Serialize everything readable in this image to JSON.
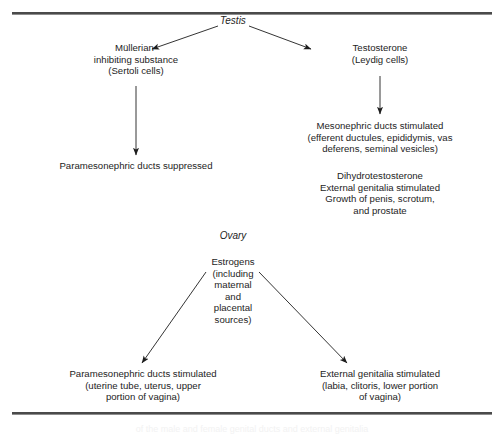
{
  "figure": {
    "type": "flow-diagram",
    "title_clipped": "of the male and female genital ducts and external genitalia",
    "rules": {
      "top_label": "top-horizontal-rule",
      "bottom_label": "bottom-horizontal-rule",
      "color": "#4a4a4a"
    },
    "branches": {
      "male": {
        "root": "Testis",
        "left": {
          "hormone": "Müllerian-\ninhibiting substance\n(Sertoli cells)",
          "effect": "Paramesonephric ducts suppressed"
        },
        "right": {
          "hormone": "Testosterone\n(Leydig cells)",
          "effect_1": "Mesonephric ducts stimulated\n(efferent ductules, epididymis, vas\ndeferens, seminal vesicles)",
          "effect_2": "Dihydrotestosterone\nExternal genitalia stimulated\nGrowth of penis, scrotum,\nand prostate"
        }
      },
      "female": {
        "root": "Ovary",
        "hormone": "Estrogens\n(including\nmaternal\nand\nplacental\nsources)",
        "left_effect": "Paramesonephric ducts stimulated\n(uterine tube, uterus, upper\nportion of vagina)",
        "right_effect": "External genitalia stimulated\n(labia, clitoris, lower portion\nof vagina)"
      }
    },
    "arrows": [
      {
        "name": "testis-to-mullerian",
        "kind": "diagonal-left-down"
      },
      {
        "name": "testis-to-testosterone",
        "kind": "diagonal-right-down"
      },
      {
        "name": "mullerian-to-paramesonephric-suppressed",
        "kind": "vertical-down"
      },
      {
        "name": "testosterone-to-mesonephric",
        "kind": "vertical-down"
      },
      {
        "name": "estrogens-to-paramesonephric-stimulated",
        "kind": "diagonal-left-down"
      },
      {
        "name": "estrogens-to-external-genitalia",
        "kind": "diagonal-right-down"
      }
    ]
  }
}
